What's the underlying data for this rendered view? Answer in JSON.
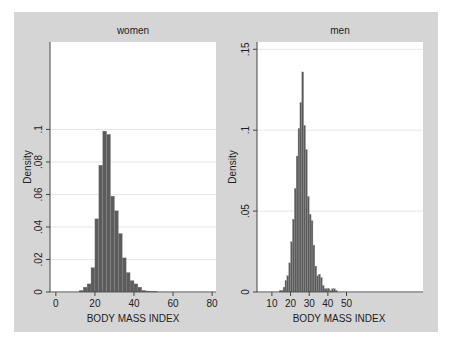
{
  "chart_data": [
    {
      "type": "bar",
      "title": "women",
      "xlabel": "BODY MASS INDEX",
      "ylabel": "Density",
      "xlim": [
        -3,
        82
      ],
      "ylim": [
        0,
        0.1538
      ],
      "x_ticks": [
        0,
        20,
        40,
        60,
        80
      ],
      "y_ticks": [
        0,
        0.02,
        0.04,
        0.06,
        0.08,
        0.1
      ],
      "y_tick_labels": [
        "0",
        ".02",
        ".04",
        ".06",
        ".08",
        ".1"
      ],
      "grid": true,
      "bin_width": 2,
      "x": [
        12,
        14,
        16,
        18,
        20,
        22,
        24,
        26,
        28,
        30,
        32,
        34,
        36,
        38,
        40,
        42,
        44,
        46,
        48,
        50
      ],
      "values": [
        0.001,
        0.003,
        0.005,
        0.015,
        0.045,
        0.078,
        0.099,
        0.097,
        0.059,
        0.05,
        0.036,
        0.021,
        0.012,
        0.007,
        0.005,
        0.003,
        0.001,
        0.0006,
        0.0005,
        0.0004
      ]
    },
    {
      "type": "bar",
      "title": "men",
      "xlabel": "BODY MASS INDEX",
      "ylabel": "Density",
      "xlim": [
        2,
        91
      ],
      "ylim": [
        0,
        0.1545
      ],
      "x_ticks": [
        10,
        20,
        30,
        40,
        50
      ],
      "y_ticks": [
        0,
        0.05,
        0.1,
        0.15
      ],
      "y_tick_labels": [
        "0",
        ".05",
        ".1",
        ".15"
      ],
      "grid": true,
      "bin_width": 1,
      "x": [
        14,
        15,
        16,
        17,
        18,
        19,
        20,
        21,
        22,
        23,
        24,
        25,
        26,
        27,
        28,
        29,
        30,
        31,
        32,
        33,
        34,
        35,
        36,
        37,
        38,
        39,
        40,
        41,
        42,
        43,
        44
      ],
      "values": [
        0.001,
        0.001,
        0.003,
        0.007,
        0.01,
        0.018,
        0.031,
        0.045,
        0.064,
        0.084,
        0.101,
        0.117,
        0.136,
        0.103,
        0.088,
        0.059,
        0.048,
        0.044,
        0.029,
        0.016,
        0.01,
        0.011,
        0.009,
        0.004,
        0.002,
        0.002,
        0.002,
        0.001,
        0.002,
        0.002,
        0.001
      ]
    }
  ],
  "panels": {
    "women": {
      "title": "women",
      "xlabel": "BODY MASS INDEX",
      "ylabel": "Density"
    },
    "men": {
      "title": "men",
      "xlabel": "BODY MASS INDEX",
      "ylabel": "Density"
    }
  },
  "colors": {
    "graph_background": "#d5d5d5",
    "plot_background": "#ffffff",
    "bar_fill": "#5c5c5c",
    "bar_edge": "#8a8a8a",
    "gridline": "#e6e6e6",
    "axis": "#444444"
  }
}
